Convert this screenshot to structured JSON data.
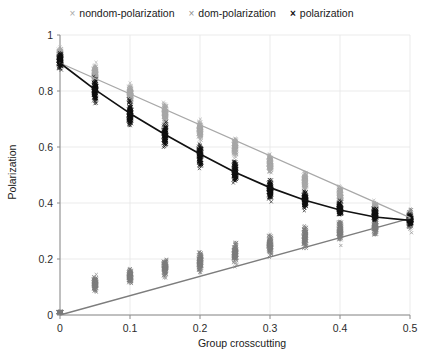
{
  "legend": {
    "position": "top-center",
    "entries": [
      {
        "label": "nondom-polarization",
        "marker": "x",
        "color": "#a8a8a8"
      },
      {
        "label": "dom-polarization",
        "marker": "x",
        "color": "#7d7d7d"
      },
      {
        "label": "polarization",
        "marker": "x",
        "color": "#111111"
      }
    ]
  },
  "chart_data": {
    "type": "scatter",
    "title": "",
    "xlabel": "Group crosscutting",
    "ylabel": "Polarization",
    "xlim": [
      0,
      0.5
    ],
    "ylim": [
      0,
      1
    ],
    "xticks": [
      0,
      0.1,
      0.2,
      0.3,
      0.4,
      0.5
    ],
    "xtick_labels": [
      "0",
      "0.1",
      "0.2",
      "0.3",
      "0.4",
      "0.5"
    ],
    "yticks": [
      0,
      0.2,
      0.4,
      0.6,
      0.8,
      1
    ],
    "ytick_labels": [
      "0",
      "0.2",
      "0.4",
      "0.6",
      "0.8",
      "1"
    ],
    "grid": true,
    "x": [
      0,
      0.05,
      0.1,
      0.15,
      0.2,
      0.25,
      0.3,
      0.35,
      0.4,
      0.45,
      0.5
    ],
    "series": [
      {
        "name": "polarization",
        "color": "#111111",
        "marker": "x",
        "description": "overall polarization; declines from ~0.9 to ~0.34",
        "means": [
          0.91,
          0.8,
          0.72,
          0.64,
          0.57,
          0.51,
          0.45,
          0.41,
          0.38,
          0.36,
          0.34
        ],
        "spread_low": [
          0.8,
          0.62,
          0.54,
          0.47,
          0.42,
          0.38,
          0.35,
          0.32,
          0.3,
          0.29,
          0.28
        ],
        "spread_high": [
          1.0,
          0.93,
          0.84,
          0.76,
          0.7,
          0.64,
          0.58,
          0.52,
          0.47,
          0.44,
          0.41
        ],
        "trend": {
          "type": "curve",
          "points": [
            [
              0,
              0.9
            ],
            [
              0.05,
              0.805
            ],
            [
              0.1,
              0.72
            ],
            [
              0.15,
              0.645
            ],
            [
              0.2,
              0.575
            ],
            [
              0.25,
              0.51
            ],
            [
              0.3,
              0.455
            ],
            [
              0.35,
              0.41
            ],
            [
              0.4,
              0.375
            ],
            [
              0.45,
              0.35
            ],
            [
              0.5,
              0.338
            ]
          ]
        }
      },
      {
        "name": "dom-polarization",
        "color": "#7d7d7d",
        "marker": "x",
        "description": "dominant-group polarization; rises from ~0.0 to ~0.34",
        "means": [
          0.01,
          0.11,
          0.14,
          0.17,
          0.19,
          0.22,
          0.25,
          0.28,
          0.3,
          0.32,
          0.34
        ],
        "spread_low": [
          0.0,
          0.04,
          0.05,
          0.07,
          0.08,
          0.1,
          0.13,
          0.16,
          0.19,
          0.21,
          0.23
        ],
        "spread_high": [
          0.02,
          0.2,
          0.24,
          0.28,
          0.31,
          0.35,
          0.39,
          0.42,
          0.44,
          0.45,
          0.46
        ],
        "trend": {
          "type": "line",
          "points": [
            [
              0,
              0.0
            ],
            [
              0.5,
              0.345
            ]
          ]
        }
      },
      {
        "name": "nondom-polarization",
        "color": "#a8a8a8",
        "marker": "x",
        "description": "non-dominant-group polarization; declines from ~0.9 to ~0.34",
        "means": [
          0.93,
          0.86,
          0.79,
          0.72,
          0.66,
          0.6,
          0.54,
          0.48,
          0.43,
          0.38,
          0.35
        ],
        "spread_low": [
          0.84,
          0.74,
          0.68,
          0.62,
          0.57,
          0.52,
          0.46,
          0.41,
          0.36,
          0.32,
          0.3
        ],
        "spread_high": [
          1.0,
          0.97,
          0.9,
          0.84,
          0.79,
          0.73,
          0.67,
          0.61,
          0.55,
          0.49,
          0.44
        ],
        "trend": {
          "type": "line",
          "points": [
            [
              0,
              0.9
            ],
            [
              0.5,
              0.348
            ]
          ]
        }
      }
    ]
  }
}
